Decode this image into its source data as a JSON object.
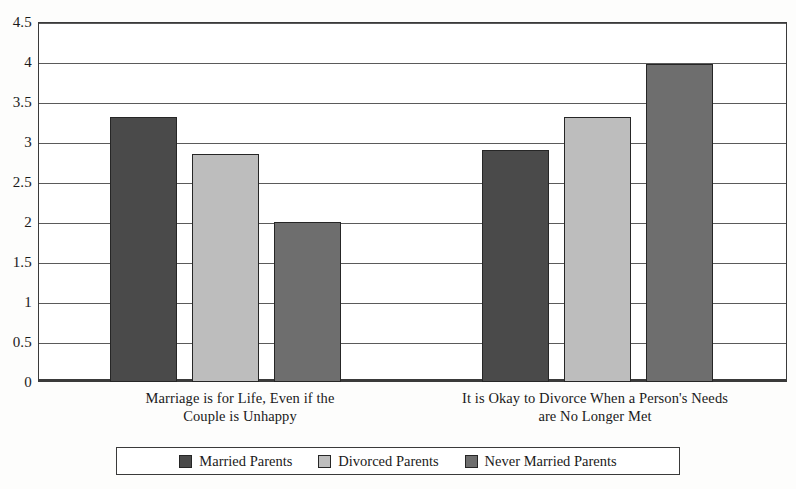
{
  "chart_data": {
    "type": "bar",
    "title": "",
    "subtitle": "",
    "xlabel": "",
    "ylabel": "",
    "ylim": [
      0,
      4.5
    ],
    "ytick_labels": [
      "0",
      "0.5",
      "1",
      "1.5",
      "2",
      "2.5",
      "3",
      "3.5",
      "4",
      "4.5"
    ],
    "ytick_values": [
      0,
      0.5,
      1,
      1.5,
      2,
      2.5,
      3,
      3.5,
      4,
      4.5
    ],
    "grid": "horizontal",
    "legend_position": "bottom",
    "categories": [
      "Marriage is for Life, Even if the Couple is Unhappy",
      "It is Okay to Divorce When a Person's Needs are No Longer Met"
    ],
    "category_lines": [
      [
        "Marriage is for Life, Even if the",
        "Couple is Unhappy"
      ],
      [
        "It is Okay to Divorce When a Person's Needs",
        "are No Longer Met"
      ]
    ],
    "series": [
      {
        "name": "Married Parents",
        "color": "#4a4a4a",
        "values": [
          3.31,
          2.9
        ]
      },
      {
        "name": "Divorced Parents",
        "color": "#bdbdbd",
        "values": [
          2.85,
          3.31
        ]
      },
      {
        "name": "Never Married Parents",
        "color": "#6e6e6e",
        "values": [
          2.0,
          3.98
        ]
      }
    ]
  },
  "legend": {
    "items": [
      {
        "label": "Married Parents",
        "color": "#4a4a4a"
      },
      {
        "label": "Divorced Parents",
        "color": "#bdbdbd"
      },
      {
        "label": "Never Married Parents",
        "color": "#6e6e6e"
      }
    ]
  }
}
